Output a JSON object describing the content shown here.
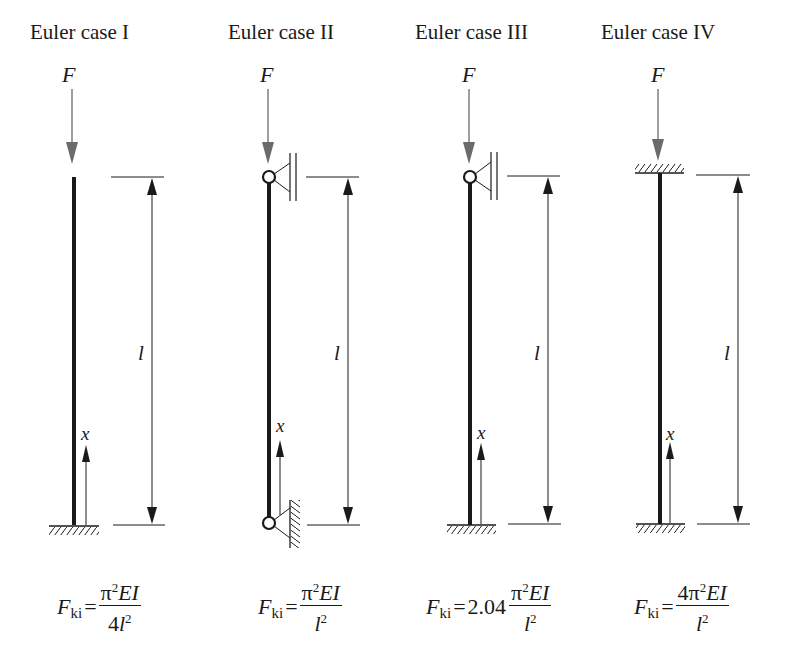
{
  "cases": [
    {
      "title": "Euler case I",
      "force_label": "F",
      "length_label": "l",
      "axis_label": "x",
      "formula": {
        "lhs": "F",
        "lhs_sub": "ki",
        "eq": "=",
        "coef": "",
        "num_pre": "",
        "num_pi": "π",
        "num_exp": "2",
        "num_rest": "EI",
        "den_pre": "4",
        "den_var": "l",
        "den_exp": "2"
      }
    },
    {
      "title": "Euler case II",
      "force_label": "F",
      "length_label": "l",
      "axis_label": "x",
      "formula": {
        "lhs": "F",
        "lhs_sub": "ki",
        "eq": "=",
        "coef": "",
        "num_pre": "",
        "num_pi": "π",
        "num_exp": "2",
        "num_rest": "EI",
        "den_pre": "",
        "den_var": "l",
        "den_exp": "2"
      }
    },
    {
      "title": "Euler case III",
      "force_label": "F",
      "length_label": "l",
      "axis_label": "x",
      "formula": {
        "lhs": "F",
        "lhs_sub": "ki",
        "eq": "=",
        "coef": "2.04",
        "num_pre": "",
        "num_pi": "π",
        "num_exp": "2",
        "num_rest": "EI",
        "den_pre": "",
        "den_var": "l",
        "den_exp": "2"
      }
    },
    {
      "title": "Euler case IV",
      "force_label": "F",
      "length_label": "l",
      "axis_label": "x",
      "formula": {
        "lhs": "F",
        "lhs_sub": "ki",
        "eq": "=",
        "coef": "",
        "num_pre": "4",
        "num_pi": "π",
        "num_exp": "2",
        "num_rest": "EI",
        "den_pre": "",
        "den_var": "l",
        "den_exp": "2"
      }
    }
  ],
  "colors": {
    "line": "#1a1a1a",
    "force_arrow": "#6b6b6b",
    "background": "#ffffff"
  }
}
